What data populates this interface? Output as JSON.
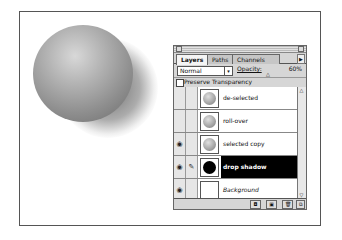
{
  "panel": {
    "tabs": [
      {
        "label": "Layers",
        "active": true
      },
      {
        "label": "Paths",
        "active": false
      },
      {
        "label": "Channels",
        "active": false
      }
    ],
    "menu_arrow": "▶",
    "blend_mode": "Normal",
    "dropdown_glyph": "▾",
    "opacity_label": "Opacity:",
    "opacity_value": "60%",
    "slider_glyph": "△",
    "preserve_transparency_label": "Preserve Transparency",
    "layers": [
      {
        "name": "de-selected",
        "visible": false,
        "brush": false,
        "thumb": "sphere"
      },
      {
        "name": "roll-over",
        "visible": false,
        "brush": false,
        "thumb": "sphere"
      },
      {
        "name": "selected copy",
        "visible": true,
        "brush": false,
        "thumb": "sphere"
      },
      {
        "name": "drop shadow",
        "visible": true,
        "brush": true,
        "thumb": "black",
        "selected": true
      },
      {
        "name": "Background",
        "visible": true,
        "brush": false,
        "thumb": "white"
      }
    ],
    "eye_glyph": "◉",
    "brush_glyph": "✎",
    "scroll_up": "△",
    "scroll_down": "▽",
    "bottom_buttons": [
      "◘",
      "▣",
      "🗑",
      "⧉"
    ]
  }
}
